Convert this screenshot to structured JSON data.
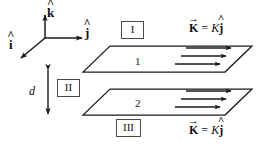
{
  "figure": {
    "background": "#ffffff",
    "stroke_color": "#1a1a1a",
    "box_border_color": "#4a4a4a"
  },
  "axes": {
    "origin": {
      "x": 45,
      "y": 38
    },
    "k_label": "k",
    "k_hat": "^",
    "j_label": "j",
    "j_hat": "^",
    "i_label": "i",
    "i_hat": "^"
  },
  "regions": [
    {
      "id": "region-I",
      "label": "I"
    },
    {
      "id": "region-II",
      "label": "II"
    },
    {
      "id": "region-III",
      "label": "III"
    }
  ],
  "sheets": [
    {
      "id": "sheet-1",
      "number": "1",
      "current_label": {
        "vector": "K",
        "vector_arrow": "→",
        "equals": "=",
        "magnitude": "K",
        "direction": "j",
        "direction_hat": "^"
      },
      "arrow_count": 3
    },
    {
      "id": "sheet-2",
      "number": "2",
      "current_label": {
        "vector": "K",
        "vector_arrow": "→",
        "equals": "=",
        "magnitude": "K",
        "direction": "j",
        "direction_hat": "^"
      },
      "arrow_count": 3
    }
  ],
  "separation": {
    "label": "d",
    "description": "gap between sheet 1 and sheet 2"
  }
}
